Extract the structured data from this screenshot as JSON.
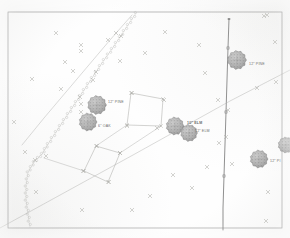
{
  "document": {
    "kind": "survey-site-plan",
    "title": "Tree Location Survey Plan",
    "border_color": "#9a9a9a",
    "line_color": "#b4b4b0",
    "heavy_line_color": "#6d6d6d",
    "tree_fill": "#8e8e8e",
    "marker_color": "#a9a9a4",
    "label_color": "#5f5f5f"
  },
  "labels": [
    {
      "id": "tree-label-1",
      "text": "12\" PINE",
      "x": 108,
      "y": 100
    },
    {
      "id": "tree-label-2",
      "text": "6\" OAK",
      "x": 98,
      "y": 124
    },
    {
      "id": "tree-label-3",
      "text": "10\" ELM",
      "x": 187,
      "y": 121
    },
    {
      "id": "tree-label-4",
      "text": "12\" ELM",
      "x": 195,
      "y": 129
    },
    {
      "id": "tree-label-5",
      "text": "12\" PINE",
      "x": 249,
      "y": 62
    },
    {
      "id": "tree-label-6",
      "text": "12\" PI",
      "x": 270,
      "y": 159
    }
  ],
  "trees": [
    {
      "id": "tree-1",
      "cx": 97,
      "cy": 105,
      "r": 9.5,
      "species": "PINE",
      "diameter": "12\""
    },
    {
      "id": "tree-2",
      "cx": 88,
      "cy": 122,
      "r": 9.0,
      "species": "OAK",
      "diameter": "6\""
    },
    {
      "id": "tree-3",
      "cx": 175,
      "cy": 126,
      "r": 9.0,
      "species": "ELM",
      "diameter": "10\""
    },
    {
      "id": "tree-4",
      "cx": 189,
      "cy": 133,
      "r": 8.5,
      "species": "ELM",
      "diameter": "12\""
    },
    {
      "id": "tree-5",
      "cx": 237,
      "cy": 60,
      "r": 9.5,
      "species": "PINE",
      "diameter": "12\""
    },
    {
      "id": "tree-6",
      "cx": 259,
      "cy": 159,
      "r": 9.0,
      "species": "PI",
      "diameter": "12\""
    },
    {
      "id": "tree-7",
      "cx": 286,
      "cy": 145,
      "r": 8.0,
      "species": "",
      "diameter": ""
    }
  ],
  "spot_markers": [
    {
      "x": 56,
      "y": 33
    },
    {
      "x": 81,
      "y": 45
    },
    {
      "x": 165,
      "y": 32
    },
    {
      "x": 145,
      "y": 53
    },
    {
      "x": 199,
      "y": 45
    },
    {
      "x": 267,
      "y": 15
    },
    {
      "x": 275,
      "y": 42
    },
    {
      "x": 205,
      "y": 73
    },
    {
      "x": 32,
      "y": 79
    },
    {
      "x": 61,
      "y": 89
    },
    {
      "x": 14,
      "y": 122
    },
    {
      "x": 81,
      "y": 51
    },
    {
      "x": 108,
      "y": 40
    },
    {
      "x": 116,
      "y": 33
    },
    {
      "x": 121,
      "y": 36
    },
    {
      "x": 81,
      "y": 104
    },
    {
      "x": 81,
      "y": 112
    },
    {
      "x": 80,
      "y": 97
    },
    {
      "x": 73,
      "y": 71
    },
    {
      "x": 65,
      "y": 62
    },
    {
      "x": 132,
      "y": 93
    },
    {
      "x": 164,
      "y": 100
    },
    {
      "x": 157,
      "y": 128
    },
    {
      "x": 127,
      "y": 126
    },
    {
      "x": 97,
      "y": 146
    },
    {
      "x": 120,
      "y": 153
    },
    {
      "x": 83,
      "y": 171
    },
    {
      "x": 109,
      "y": 182
    },
    {
      "x": 46,
      "y": 156
    },
    {
      "x": 35,
      "y": 160
    },
    {
      "x": 25,
      "y": 152
    },
    {
      "x": 219,
      "y": 143
    },
    {
      "x": 226,
      "y": 137
    },
    {
      "x": 228,
      "y": 110
    },
    {
      "x": 232,
      "y": 164
    },
    {
      "x": 207,
      "y": 167
    },
    {
      "x": 192,
      "y": 188
    },
    {
      "x": 173,
      "y": 175
    },
    {
      "x": 150,
      "y": 196
    },
    {
      "x": 132,
      "y": 210
    },
    {
      "x": 218,
      "y": 100
    },
    {
      "x": 264,
      "y": 16
    },
    {
      "x": 82,
      "y": 210
    },
    {
      "x": 268,
      "y": 192
    },
    {
      "x": 266,
      "y": 221
    },
    {
      "x": 36,
      "y": 192
    },
    {
      "x": 120,
      "y": 61
    },
    {
      "x": 96,
      "y": 72
    },
    {
      "x": 93,
      "y": 80
    },
    {
      "x": 276,
      "y": 82
    },
    {
      "x": 257,
      "y": 88
    }
  ],
  "parcels": [
    {
      "id": "parcel-upper",
      "points": "131,93 163,99 161,126 127,125"
    },
    {
      "id": "parcel-lower",
      "points": "96,146 120,153 108,182 84,171"
    }
  ],
  "lines": [
    {
      "id": "property-line-vertical",
      "kind": "heavy",
      "points": "229,19 228,48 227,80 226,112 225,144 224,176 223,208 223,230"
    },
    {
      "id": "road-line-diagonal",
      "kind": "light",
      "points": "0,228 133,155 230,101 290,70"
    },
    {
      "id": "boundary-line-nw",
      "kind": "light",
      "points": "132,15 110,40 88,66 66,92 44,118 22,145"
    },
    {
      "id": "parcel-tie-left",
      "kind": "light",
      "points": "44,158 84,171"
    },
    {
      "id": "parcel-tie-mid",
      "kind": "light",
      "points": "120,153 161,126"
    },
    {
      "id": "parcel-tie-upper",
      "kind": "light",
      "points": "96,146 127,125"
    }
  ],
  "tree_line": {
    "id": "vegetation-line",
    "description": "scalloped tree line / vegetation boundary",
    "path_main": "136,13 128,25 120,37 112,49 104,60 96,72 88,84 80,96 72,108 64,120 56,132 48,144 42,154",
    "path_branch": "42,154 34,162 28,172 26,186 26,200 28,214 30,228"
  },
  "border": {
    "x": 8,
    "y": 12,
    "width": 274,
    "height": 216
  }
}
